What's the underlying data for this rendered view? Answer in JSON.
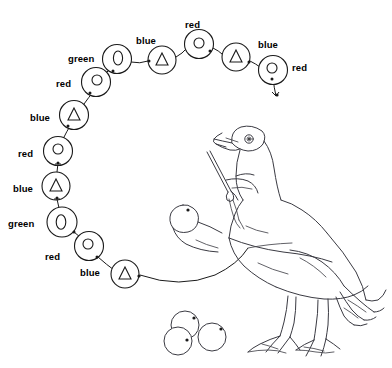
{
  "diagram": {
    "stroke_color": "#1a1a1a",
    "bird_stroke_color": "#3a3a42",
    "background": "#ffffff",
    "glyph_legend": {
      "red": "circle-glyph",
      "blue": "triangle-glyph",
      "green": "oval-glyph"
    },
    "nodes": [
      {
        "id": "n1",
        "label": "green",
        "glyph": "oval",
        "cx": 117,
        "cy": 59,
        "r": 14.5,
        "label_x": 68,
        "label_y": 54
      },
      {
        "id": "n2",
        "label": "blue",
        "glyph": "triangle",
        "cx": 162,
        "cy": 60,
        "r": 14.0,
        "label_x": 136,
        "label_y": 36
      },
      {
        "id": "n3",
        "label": "red",
        "glyph": "circle",
        "cx": 199,
        "cy": 44,
        "r": 14.5,
        "label_x": 185,
        "label_y": 20
      },
      {
        "id": "n4",
        "label": "blue",
        "glyph": "triangle",
        "cx": 236,
        "cy": 57,
        "r": 14.0,
        "label_x": 258,
        "label_y": 40
      },
      {
        "id": "n5",
        "label": "red",
        "glyph": "circle",
        "cx": 273,
        "cy": 70,
        "r": 14.5,
        "label_x": 292,
        "label_y": 63
      },
      {
        "id": "n6",
        "label": "red",
        "glyph": "circle",
        "cx": 96,
        "cy": 82,
        "r": 14.5,
        "label_x": 56,
        "label_y": 79
      },
      {
        "id": "n7",
        "label": "blue",
        "glyph": "triangle",
        "cx": 74,
        "cy": 115,
        "r": 14.5,
        "label_x": 30,
        "label_y": 113
      },
      {
        "id": "n8",
        "label": "red",
        "glyph": "circle",
        "cx": 58,
        "cy": 151,
        "r": 14.5,
        "label_x": 18,
        "label_y": 149
      },
      {
        "id": "n9",
        "label": "blue",
        "glyph": "triangle",
        "cx": 56,
        "cy": 186,
        "r": 14.0,
        "label_x": 13,
        "label_y": 184
      },
      {
        "id": "n10",
        "label": "green",
        "glyph": "oval",
        "cx": 62,
        "cy": 222,
        "r": 15.0,
        "label_x": 8,
        "label_y": 219
      },
      {
        "id": "n11",
        "label": "red",
        "glyph": "circle",
        "cx": 89,
        "cy": 246,
        "r": 14.5,
        "label_x": 45,
        "label_y": 252
      },
      {
        "id": "n12",
        "label": "blue",
        "glyph": "triangle",
        "cx": 125,
        "cy": 274,
        "r": 14.0,
        "label_x": 80,
        "label_y": 268
      }
    ],
    "loose_circles": [
      {
        "id": "c1",
        "cx": 185,
        "cy": 325,
        "r": 14.0,
        "dot_x": 194,
        "dot_y": 318
      },
      {
        "id": "c2",
        "cx": 178,
        "cy": 341,
        "r": 14.0,
        "dot_x": 187,
        "dot_y": 340
      },
      {
        "id": "c3",
        "cx": 212,
        "cy": 337,
        "r": 14.0,
        "dot_x": 221,
        "dot_y": 329
      }
    ],
    "bird": {
      "name": "goose-illustration",
      "has_scissors": true,
      "eye_dot": true,
      "second_head_dot": true
    }
  }
}
